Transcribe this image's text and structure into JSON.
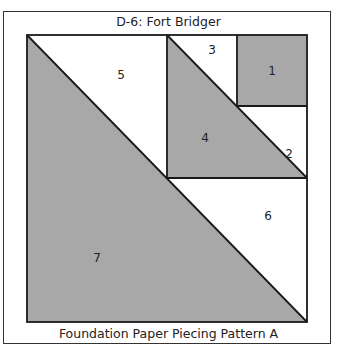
{
  "title": "D-6: Fort Bridger",
  "caption": "Foundation Paper Piecing Pattern A",
  "colors": {
    "fill_gray": "#a8a8a8",
    "fill_white": "#ffffff",
    "line": "#1a1a1a"
  },
  "pieces": [
    {
      "label": "1",
      "fill": "gray"
    },
    {
      "label": "2",
      "fill": "white"
    },
    {
      "label": "3",
      "fill": "white"
    },
    {
      "label": "4",
      "fill": "gray"
    },
    {
      "label": "5",
      "fill": "white"
    },
    {
      "label": "6",
      "fill": "white"
    },
    {
      "label": "7",
      "fill": "gray"
    }
  ]
}
